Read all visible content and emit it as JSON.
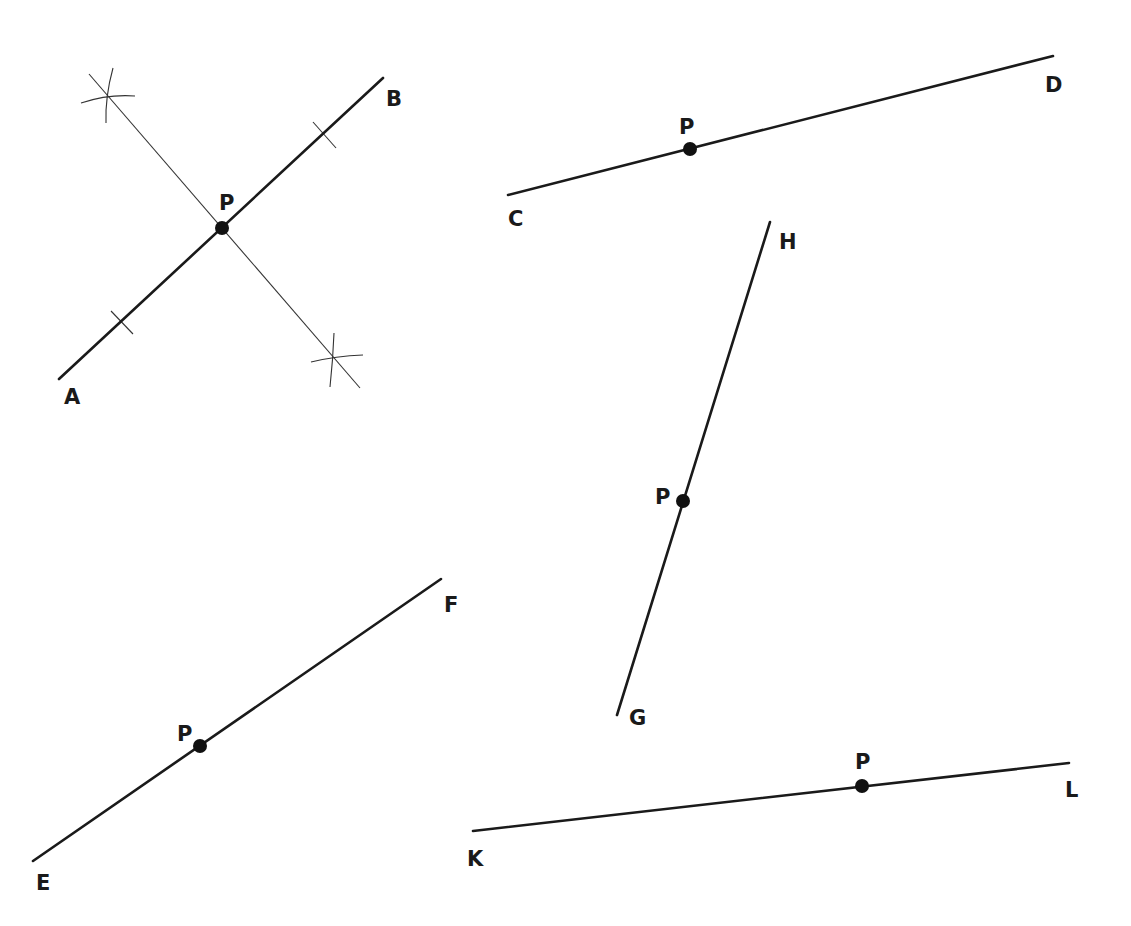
{
  "diagram": {
    "colors": {
      "ink": "#1a1a1a",
      "construction": "#333333",
      "background": "#ffffff"
    },
    "figures": [
      {
        "id": "AB",
        "segment": {
          "start": "A",
          "end": "B",
          "x1": 59,
          "y1": 379,
          "x2": 383,
          "y2": 78
        },
        "point": {
          "label": "P",
          "x": 222,
          "y": 228,
          "label_x": 219,
          "label_y": 210
        },
        "labels": {
          "start": {
            "text": "A",
            "x": 64,
            "y": 404
          },
          "end": {
            "text": "B",
            "x": 386,
            "y": 106
          }
        },
        "construction": {
          "perpendicular": {
            "x1": 89,
            "y1": 74,
            "x2": 360,
            "y2": 388
          },
          "tick_marks": [
            {
              "x1": 111,
              "y1": 311,
              "x2": 133,
              "y2": 334
            },
            {
              "x1": 313,
              "y1": 122,
              "x2": 336,
              "y2": 148
            }
          ],
          "arc_crosses": [
            {
              "x": 108,
              "y": 97,
              "h": [
                81,
                103,
                135,
                96
              ],
              "v": [
                113,
                68,
                106,
                123
              ]
            },
            {
              "x": 336,
              "y": 359,
              "h": [
                311,
                362,
                363,
                355
              ],
              "v": [
                334,
                333,
                330,
                387
              ]
            }
          ]
        }
      },
      {
        "id": "CD",
        "segment": {
          "start": "C",
          "end": "D",
          "x1": 508,
          "y1": 195,
          "x2": 1053,
          "y2": 56
        },
        "point": {
          "label": "P",
          "x": 690,
          "y": 149,
          "label_x": 679,
          "label_y": 134
        },
        "labels": {
          "start": {
            "text": "C",
            "x": 508,
            "y": 226
          },
          "end": {
            "text": "D",
            "x": 1045,
            "y": 92
          }
        }
      },
      {
        "id": "GH",
        "segment": {
          "start": "G",
          "end": "H",
          "x1": 617,
          "y1": 715,
          "x2": 770,
          "y2": 222
        },
        "point": {
          "label": "P",
          "x": 683,
          "y": 501,
          "label_x": 655,
          "label_y": 504
        },
        "labels": {
          "start": {
            "text": "G",
            "x": 629,
            "y": 725
          },
          "end": {
            "text": "H",
            "x": 779,
            "y": 249
          }
        }
      },
      {
        "id": "EF",
        "segment": {
          "start": "E",
          "end": "F",
          "x1": 33,
          "y1": 861,
          "x2": 441,
          "y2": 579
        },
        "point": {
          "label": "P",
          "x": 200,
          "y": 746,
          "label_x": 177,
          "label_y": 741
        },
        "labels": {
          "start": {
            "text": "E",
            "x": 36,
            "y": 890
          },
          "end": {
            "text": "F",
            "x": 444,
            "y": 612
          }
        }
      },
      {
        "id": "KL",
        "segment": {
          "start": "K",
          "end": "L",
          "x1": 473,
          "y1": 831,
          "x2": 1069,
          "y2": 763
        },
        "point": {
          "label": "P",
          "x": 862,
          "y": 786,
          "label_x": 855,
          "label_y": 769
        },
        "labels": {
          "start": {
            "text": "K",
            "x": 467,
            "y": 866
          },
          "end": {
            "text": "L",
            "x": 1065,
            "y": 797
          }
        }
      }
    ]
  }
}
